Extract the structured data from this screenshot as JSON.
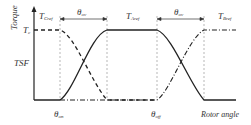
{
  "diagram": {
    "title": "",
    "y_axis_label": "Torque",
    "x_axis_label": "Rotor angle",
    "left_label": "TSF",
    "level_label": {
      "main": "T",
      "sub": "c"
    },
    "curve_labels": {
      "c_ref": {
        "main": "T",
        "sub": "Cref"
      },
      "a_ref": {
        "main": "T",
        "sub": "Aref"
      },
      "b_ref": {
        "main": "T",
        "sub": "Bref"
      }
    },
    "overlap_labels": [
      {
        "main": "θ",
        "sub": "ov"
      },
      {
        "main": "θ",
        "sub": "ov"
      }
    ],
    "angle_labels": {
      "on": {
        "main": "θ",
        "sub": "on"
      },
      "off": {
        "main": "θ",
        "sub": "off"
      }
    },
    "colors": {
      "line": "#222222",
      "guide": "#888888",
      "text": "#333333"
    }
  }
}
